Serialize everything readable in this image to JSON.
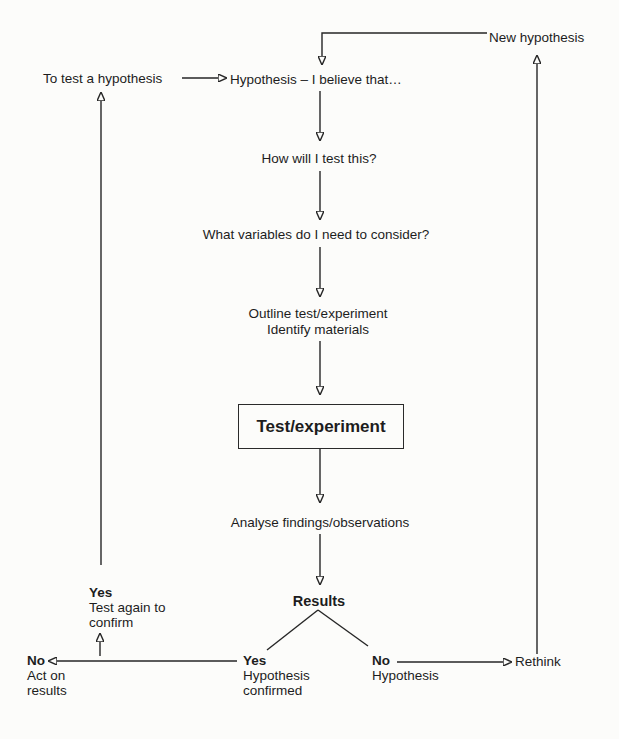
{
  "page": {
    "background_color": "#fcfcfa",
    "ink_color": "#1d1d1d"
  },
  "flow": {
    "new_hypothesis": "New hypothesis",
    "to_test": "To test a hypothesis",
    "hypothesis": "Hypothesis – I believe that…",
    "how_test": "How will I test this?",
    "variables": "What variables do I need to consider?",
    "outline": {
      "line1": "Outline test/experiment",
      "line2": "Identify materials"
    },
    "test_box": "Test/experiment",
    "analyse": "Analyse findings/observations",
    "results": "Results",
    "retest": {
      "label": "Yes",
      "line1": "Test again to",
      "line2": "confirm"
    },
    "act": {
      "label": "No",
      "line1": "Act on",
      "line2": "results"
    },
    "confirmed": {
      "label": "Yes",
      "line1": "Hypothesis",
      "line2": "confirmed"
    },
    "rejected": {
      "label": "No",
      "line1": "Hypothesis"
    },
    "rethink": "Rethink"
  }
}
